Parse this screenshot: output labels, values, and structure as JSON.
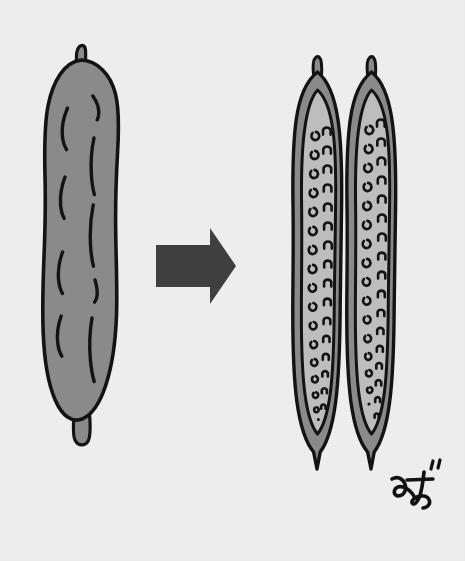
{
  "figure": {
    "title": "Pod splitting into two seed-bearing halves",
    "background_color": "#f0f0f0"
  },
  "palette": {
    "background": "#f0f0f0",
    "ink": "#131313",
    "rind_gray": "#8a8a8a",
    "flesh_light_gray": "#bdbdbd",
    "arrow_gray": "#3f3f3f",
    "signature_ink": "#111111"
  },
  "stages": [
    {
      "id": "whole-pod",
      "label": "Whole pod",
      "fill_color": "#8a8a8a",
      "outline_color": "#131313",
      "surface_mark_count": 9,
      "surface_mark_columns": 2,
      "has_top_stem": true,
      "has_bottom_stub": true
    },
    {
      "id": "split-pod",
      "label": "Split pod halves",
      "half_count": 2,
      "rind_color": "#8a8a8a",
      "flesh_color": "#bdbdbd",
      "outline_color": "#131313",
      "seed_columns_per_half": 2,
      "seeds_per_half": 36,
      "has_top_stem": true,
      "has_bottom_tip": true
    }
  ],
  "arrow": {
    "label": "transforms into",
    "direction": "right",
    "color": "#3f3f3f"
  },
  "signature": {
    "label": "artist-signature",
    "text": "handwritten kana signature",
    "color": "#111111"
  }
}
